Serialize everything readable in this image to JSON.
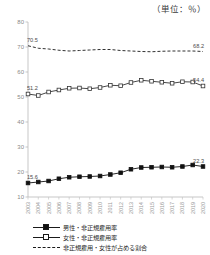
{
  "unit_note": "（単位：％）",
  "chart_data": {
    "type": "line",
    "title": "",
    "xlabel": "",
    "ylabel": "",
    "unit": "％",
    "grid": false,
    "legend_position": "bottom",
    "ylim": [
      10,
      80
    ],
    "yticks": [
      80,
      70,
      60,
      50,
      40,
      30,
      20,
      10
    ],
    "categories": [
      "2003",
      "2004",
      "2005",
      "2006",
      "2007",
      "2008",
      "2009",
      "2010",
      "2011",
      "2012",
      "2013",
      "2014",
      "2015",
      "2016",
      "2017",
      "2018",
      "2019",
      "2020"
    ],
    "series": [
      {
        "name": "男性・非正規雇用率",
        "marker": "filled-square",
        "line": "solid",
        "color": "#111111",
        "values": [
          15.6,
          16.0,
          16.4,
          17.3,
          17.9,
          18.1,
          18.2,
          18.4,
          19.0,
          19.7,
          21.1,
          21.8,
          21.9,
          22.0,
          21.9,
          22.2,
          22.8,
          22.2
        ],
        "start_label": "15.6",
        "end_label": "22.3"
      },
      {
        "name": "女性・非正規雇用率",
        "marker": "open-square",
        "line": "solid",
        "color": "#333333",
        "values": [
          51.2,
          50.6,
          52.0,
          52.8,
          53.5,
          53.6,
          53.3,
          53.8,
          54.7,
          54.5,
          55.8,
          56.7,
          56.3,
          55.9,
          55.5,
          56.1,
          56.0,
          54.4
        ],
        "start_label": "51.2",
        "end_label": "54.4"
      },
      {
        "name": "非正規雇用・女性が占める割合",
        "marker": "none",
        "line": "dashed",
        "color": "#1a1a1a",
        "values": [
          70.5,
          69.5,
          69.2,
          68.7,
          68.4,
          68.6,
          68.8,
          69.0,
          69.0,
          68.6,
          68.4,
          68.2,
          68.1,
          68.3,
          68.4,
          68.4,
          68.4,
          68.2
        ],
        "start_label": "70.5",
        "end_label": "68.2"
      }
    ]
  },
  "legend": [
    {
      "label": "男性・非正規雇用率",
      "style": "solid-filled"
    },
    {
      "label": "女性・非正規雇用率",
      "style": "solid-open"
    },
    {
      "label": "非正規雇用・女性が占める割合",
      "style": "dashed"
    }
  ]
}
